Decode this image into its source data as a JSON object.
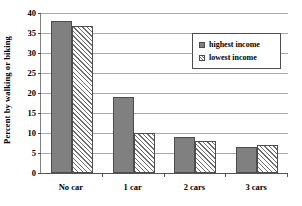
{
  "chart_data": {
    "type": "bar",
    "title": "",
    "xlabel": "",
    "ylabel": "Percent by walking or biking",
    "categories": [
      "No car",
      "1 car",
      "2 cars",
      "3 cars"
    ],
    "series": [
      {
        "name": "highest income",
        "values": [
          38,
          19,
          9,
          6.5
        ]
      },
      {
        "name": "lowest income",
        "values": [
          36.8,
          10,
          8,
          7
        ]
      }
    ],
    "ylim": [
      0,
      40
    ],
    "ytick_values": [
      0,
      5,
      10,
      15,
      20,
      25,
      30,
      35,
      40
    ],
    "ytick_labels": [
      "0",
      "5",
      "10",
      "15",
      "20",
      "25",
      "30",
      "35",
      "40"
    ],
    "grid": true,
    "legend_position": "upper right",
    "series_colors": [
      "#808080",
      "#ffffff"
    ],
    "series_patterns": [
      "solid",
      "diagonal-hatch"
    ]
  },
  "legend": {
    "entries": [
      {
        "label": "highest income"
      },
      {
        "label": "lowest income"
      }
    ]
  }
}
